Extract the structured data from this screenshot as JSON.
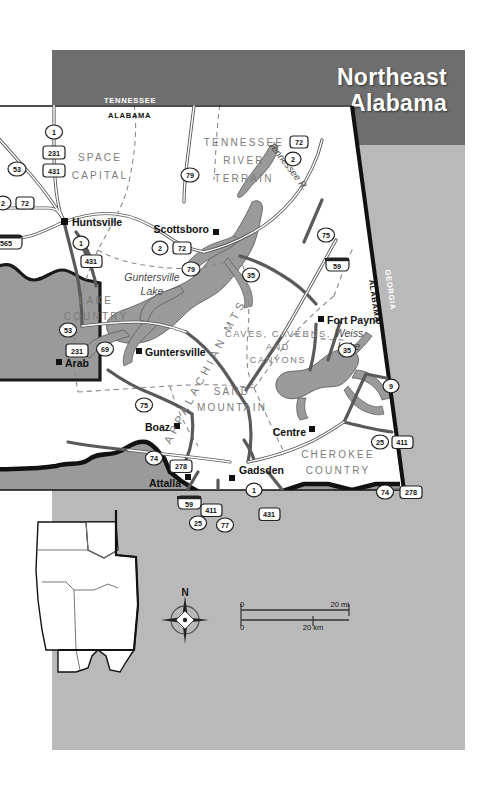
{
  "header": {
    "title_line1": "Northeast",
    "title_line2": "Alabama",
    "band_color": "#6e6e6e",
    "page_color": "#b9b9b9"
  },
  "map": {
    "state_borders": [
      {
        "name": "tennessee",
        "label": "TENNESSEE"
      },
      {
        "name": "alabama-north",
        "label": "ALABAMA"
      },
      {
        "name": "alabama-east",
        "label": "ALABAMA"
      },
      {
        "name": "georgia",
        "label": "GEORGIA"
      }
    ],
    "regions": [
      {
        "name": "space-capital",
        "lines": [
          "SPACE",
          "CAPITAL"
        ]
      },
      {
        "name": "tennessee-river-terrain",
        "lines": [
          "TENNESSEE",
          "RIVER",
          "TERRAIN"
        ]
      },
      {
        "name": "lake-country",
        "lines": [
          "LAKE",
          "COUNTRY"
        ]
      },
      {
        "name": "caves-caverns-and-canyons",
        "lines": [
          "CAVES, CAVERNS,",
          "AND",
          "CANYONS"
        ]
      },
      {
        "name": "sand-mountain",
        "lines": [
          "SAND",
          "MOUNTAIN"
        ]
      },
      {
        "name": "cherokee-country",
        "lines": [
          "CHEROKEE",
          "COUNTRY"
        ]
      },
      {
        "name": "appalachian-mts",
        "lines": [
          "APPALACHIAN MTS."
        ]
      }
    ],
    "cities": [
      {
        "name": "huntsville",
        "label": "Huntsville"
      },
      {
        "name": "scottsboro",
        "label": "Scottsboro"
      },
      {
        "name": "guntersville",
        "label": "Guntersville"
      },
      {
        "name": "arab",
        "label": "Arab"
      },
      {
        "name": "boaz",
        "label": "Boaz"
      },
      {
        "name": "attalla",
        "label": "Attalla"
      },
      {
        "name": "gadsden",
        "label": "Gadsden"
      },
      {
        "name": "fort-payne",
        "label": "Fort Payne"
      },
      {
        "name": "centre",
        "label": "Centre"
      }
    ],
    "water": [
      {
        "name": "guntersville-lake",
        "lines": [
          "Guntersville",
          "Lake"
        ]
      },
      {
        "name": "weiss-lake",
        "lines": [
          "Weiss",
          "Lake"
        ]
      },
      {
        "name": "tennessee-river",
        "label": "Tennessee R."
      }
    ],
    "route_shields": [
      {
        "name": "route-1-north",
        "label": "1",
        "type": "us"
      },
      {
        "name": "route-231-north",
        "label": "231",
        "type": "us"
      },
      {
        "name": "route-431-north",
        "label": "431",
        "type": "us"
      },
      {
        "name": "route-53-north",
        "label": "53",
        "type": "us"
      },
      {
        "name": "route-2-west",
        "label": "2",
        "type": "state"
      },
      {
        "name": "route-72-west",
        "label": "72",
        "type": "us"
      },
      {
        "name": "route-565",
        "label": "565",
        "type": "interstate"
      },
      {
        "name": "route-1-huntsville",
        "label": "1",
        "type": "state"
      },
      {
        "name": "route-431-huntsville",
        "label": "431",
        "type": "us"
      },
      {
        "name": "route-79-north",
        "label": "79",
        "type": "state"
      },
      {
        "name": "route-72-northeast",
        "label": "72",
        "type": "us"
      },
      {
        "name": "route-2-northeast",
        "label": "2",
        "type": "state"
      },
      {
        "name": "route-2-scottsboro",
        "label": "2",
        "type": "state"
      },
      {
        "name": "route-72-scottsboro",
        "label": "72",
        "type": "us"
      },
      {
        "name": "route-79-scottsboro",
        "label": "79",
        "type": "state"
      },
      {
        "name": "route-35",
        "label": "35",
        "type": "state"
      },
      {
        "name": "route-75-appalachian",
        "label": "75",
        "type": "state"
      },
      {
        "name": "route-59-fortpayne",
        "label": "59",
        "type": "interstate"
      },
      {
        "name": "route-431-lake",
        "label": "431",
        "type": "us"
      },
      {
        "name": "route-53-lake",
        "label": "53",
        "type": "state"
      },
      {
        "name": "route-231-arab",
        "label": "231",
        "type": "us"
      },
      {
        "name": "route-69",
        "label": "69",
        "type": "state"
      },
      {
        "name": "route-75-boaz",
        "label": "75",
        "type": "state"
      },
      {
        "name": "route-35-weiss",
        "label": "35",
        "type": "state"
      },
      {
        "name": "route-9",
        "label": "9",
        "type": "state"
      },
      {
        "name": "route-25-centre",
        "label": "25",
        "type": "state"
      },
      {
        "name": "route-411-centre",
        "label": "411",
        "type": "us"
      },
      {
        "name": "route-74-attalla",
        "label": "74",
        "type": "state"
      },
      {
        "name": "route-278-attalla",
        "label": "278",
        "type": "us"
      },
      {
        "name": "route-59-attalla",
        "label": "59",
        "type": "interstate"
      },
      {
        "name": "route-411-attalla",
        "label": "411",
        "type": "us"
      },
      {
        "name": "route-25-attalla",
        "label": "25",
        "type": "state"
      },
      {
        "name": "route-77",
        "label": "77",
        "type": "state"
      },
      {
        "name": "route-1-gadsden",
        "label": "1",
        "type": "state"
      },
      {
        "name": "route-431-gadsden",
        "label": "431",
        "type": "us"
      },
      {
        "name": "route-74-southeast",
        "label": "74",
        "type": "state"
      },
      {
        "name": "route-278-southeast",
        "label": "278",
        "type": "us"
      }
    ]
  },
  "compass": {
    "north_label": "N"
  },
  "scalebar": {
    "miles_zero": "0",
    "miles_max": "20 mi",
    "km_zero": "0",
    "km_max": "20 km"
  },
  "inset": {
    "name": "alabama-locator-inset"
  }
}
